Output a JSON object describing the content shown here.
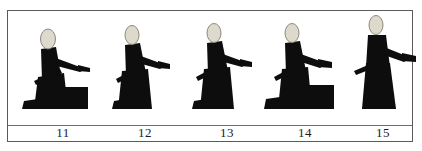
{
  "figure": {
    "kind": "pose-sequence-panel",
    "border_color": "#5a5a5e",
    "background_color": "#ffffff",
    "ground_line_color": "#6e6e72",
    "silhouette_color": "#0d0d0d",
    "head_color": "#ded9cd",
    "head_outline_color": "#8d8878",
    "frame_count": 5
  },
  "frames": [
    {
      "label": "11",
      "pose": "kneeling-low-with-bench",
      "left": 12,
      "has_bench": true,
      "bench": {
        "x": 34,
        "y": 74,
        "w": 34,
        "h": 22
      },
      "body": {
        "head_cx": 28,
        "head_cy": 26,
        "head_rx": 7.5,
        "head_ry": 10,
        "torso": "M21,36 L36,34 L41,62 L22,68 Z",
        "arm": "M33,44 L60,54 L66,56 L60,59 L33,52 Z",
        "hand": "M58,52 L70,55 L70,59 L58,58 Z",
        "sash": "M14,68 L40,56 L42,60 L16,72 Z",
        "lower": "M18,64 L44,60 L48,96 L14,96 Z",
        "foot": "M4,88 L18,86 L20,96 L2,96 Z"
      }
    },
    {
      "label": "12",
      "pose": "kneeling-upright",
      "left": 94,
      "has_bench": false,
      "body": {
        "head_cx": 30,
        "head_cy": 22,
        "head_rx": 7,
        "head_ry": 9.5,
        "torso": "M23,32 L38,30 L44,60 L24,64 Z",
        "arm": "M36,42 L58,50 L64,52 L58,56 L36,50 Z",
        "hand": "M56,48 L68,51 L68,56 L56,55 Z",
        "sash": "M14,66 L40,52 L42,57 L16,70 Z",
        "lower": "M20,58 L46,56 L50,96 L16,96 Z",
        "foot": "M12,88 L24,86 L26,96 L10,96 Z"
      }
    },
    {
      "label": "13",
      "pose": "kneeling-tall",
      "left": 176,
      "has_bench": false,
      "body": {
        "head_cx": 30,
        "head_cy": 20,
        "head_rx": 7,
        "head_ry": 9.5,
        "torso": "M23,30 L38,28 L44,58 L24,62 Z",
        "arm": "M36,40 L58,48 L64,50 L58,54 L36,48 Z",
        "hand": "M56,46 L68,49 L68,54 L56,53 Z",
        "sash": "M12,64 L38,50 L40,55 L14,68 Z",
        "lower": "M20,56 L46,54 L50,96 L16,96 Z",
        "foot": "M10,88 L22,86 L24,96 L8,96 Z"
      }
    },
    {
      "label": "14",
      "pose": "kneeling-with-bench",
      "left": 254,
      "has_bench": true,
      "bench": {
        "x": 32,
        "y": 72,
        "w": 40,
        "h": 24
      },
      "body": {
        "head_cx": 30,
        "head_cy": 20,
        "head_rx": 7,
        "head_ry": 9.5,
        "torso": "M23,30 L38,28 L44,58 L24,62 Z",
        "arm": "M36,40 L58,48 L66,50 L58,55 L36,48 Z",
        "hand": "M56,46 L70,49 L70,55 L56,54 Z",
        "sash": "M12,64 L38,50 L40,55 L14,68 Z",
        "lower": "M20,56 L46,54 L50,96 L16,96 Z",
        "foot": "M4,86 L18,84 L20,96 L2,96 Z"
      }
    },
    {
      "label": "15",
      "pose": "standing",
      "left": 332,
      "has_bench": false,
      "body": {
        "head_cx": 36,
        "head_cy": 12,
        "head_rx": 7,
        "head_ry": 9.5,
        "torso": "M28,22 L46,22 L50,54 L26,54 Z",
        "arm": "M44,34 L64,42 L72,44 L64,49 L44,42 Z",
        "hand": "M62,40 L76,43 L76,49 L62,48 Z",
        "sash": "M14,58 L42,46 L44,51 L16,62 Z",
        "lower": "M26,50 L50,50 L56,96 L22,96 Z",
        "foot": "M24,92 L54,92 L56,96 L22,96 Z"
      }
    }
  ]
}
